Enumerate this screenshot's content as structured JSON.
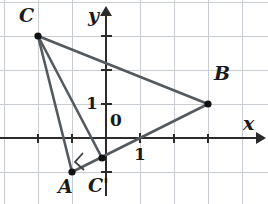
{
  "figure": {
    "type": "geometry-diagram",
    "background_color": "#ffffff",
    "grid_color": "#c9cdd2",
    "axis_color": "#2b2b2b",
    "segment_color": "#555a5f",
    "point_color": "#111111",
    "label_color": "#1a1a1a"
  },
  "axes": {
    "x_label": "x",
    "y_label": "y",
    "origin_label": "0",
    "x_unit_label": "1",
    "y_unit_label": "1",
    "x_range": [
      -3,
      4.6
    ],
    "y_range": [
      -2,
      3.8
    ],
    "grid": true,
    "unit_px": 34,
    "origin_px": [
      106,
      138
    ]
  },
  "points": [
    {
      "name": "C",
      "label": "C",
      "x": -2,
      "y": 3,
      "px": [
        38,
        36
      ],
      "label_px": [
        20,
        13
      ]
    },
    {
      "name": "B",
      "label": "B",
      "x": 3,
      "y": 1,
      "px": [
        208,
        104
      ],
      "label_px": [
        214,
        74
      ]
    },
    {
      "name": "A",
      "label": "A",
      "x": -1,
      "y": -1,
      "px": [
        72,
        172
      ],
      "label_px": [
        60,
        180
      ]
    },
    {
      "name": "Cp",
      "label": "C'",
      "x": -0.12,
      "y": -0.59,
      "px": [
        102,
        158
      ],
      "label_px": [
        92,
        180
      ]
    }
  ],
  "segments": [
    {
      "name": "CB",
      "from": "C",
      "to": "B"
    },
    {
      "name": "CA",
      "from": "C",
      "to": "A"
    },
    {
      "name": "CCp",
      "from": "C",
      "to": "Cp"
    },
    {
      "name": "AB",
      "from": "A",
      "to": "B"
    }
  ],
  "markers": [
    {
      "name": "right-angle-at-C-prime",
      "at": "Cp",
      "type": "right-angle-square"
    }
  ]
}
